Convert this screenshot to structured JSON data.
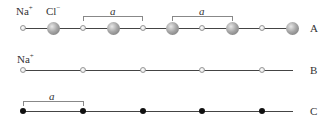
{
  "rows": [
    {
      "id": "A",
      "label": "A",
      "description": "NaCl 1D lattice with alternating Na+ and Cl- ions",
      "ion_labels": [
        {
          "text": "Na",
          "charge": "+"
        },
        {
          "text": "Cl",
          "charge": "−"
        }
      ],
      "atoms": [
        "Na",
        "Cl",
        "Na",
        "Cl",
        "Na",
        "Cl",
        "Na",
        "Cl",
        "Na",
        "Cl"
      ],
      "brackets": [
        {
          "label": "a",
          "from_index": 2,
          "to_index": 4
        },
        {
          "label": "a",
          "from_index": 5,
          "to_index": 7
        }
      ]
    },
    {
      "id": "B",
      "label": "B",
      "description": "Na+ sublattice only",
      "ion_labels": [
        {
          "text": "Na",
          "charge": "+"
        }
      ],
      "atoms": [
        "Na",
        "Na",
        "Na",
        "Na",
        "Na"
      ]
    },
    {
      "id": "C",
      "label": "C",
      "description": "Lattice points (Bravais lattice)",
      "points": 5,
      "brackets": [
        {
          "label": "a",
          "from_index": 0,
          "to_index": 1
        }
      ]
    }
  ],
  "colors": {
    "line": "#444444",
    "small_atom": "#e6e6e6",
    "large_atom": "#8a8a8a",
    "lattice_point": "#111111",
    "bracket": "#888888"
  }
}
